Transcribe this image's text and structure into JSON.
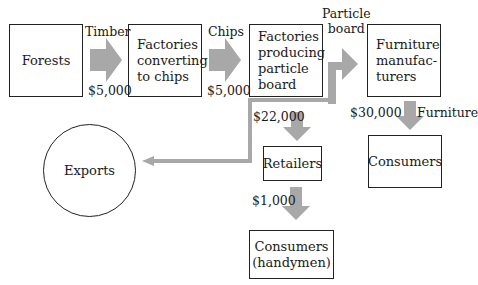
{
  "diagram": {
    "nodes": {
      "forests": "Forests",
      "chip_factories": "Factories\nconverting\nto chips",
      "particle_factories": "Factories\nproducing\nparticle\nboard",
      "furniture_manufacturers": "Furniture\nmanufac-\nturers",
      "exports": "Exports",
      "retailers": "Retailers",
      "consumers": "Consumers",
      "consumers_handymen": "Consumers\n(handymen)"
    },
    "flows": {
      "timber_label": "Timber",
      "timber_value": "$5,000",
      "chips_label": "Chips",
      "chips_value": "$5,000",
      "particle_label": "Particle\nboard",
      "retailers_value": "$22,000",
      "furniture_value": "$30,000",
      "furniture_label": "Furniture",
      "handymen_value": "$1,000"
    },
    "colors": {
      "arrow": "#a8a8a8",
      "border": "#222222"
    }
  }
}
